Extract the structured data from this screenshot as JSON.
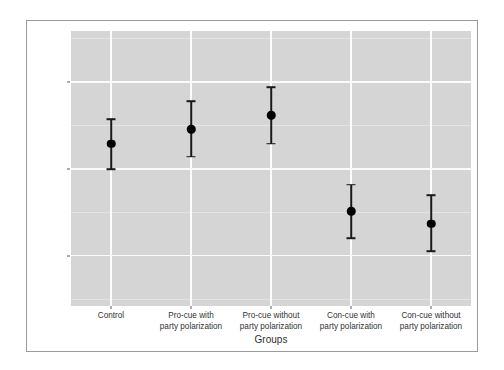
{
  "chart_data": {
    "type": "scatter",
    "title": "",
    "subtitle": "",
    "xlabel": "Groups",
    "ylabel_line1": "Support for the DREAM act",
    "ylabel_line2": "(7, stronger support, covariate is assumed at its mean)",
    "categories": [
      "Control",
      "Pro-cue with party polarization",
      "Pro-cue without party polarization",
      "Con-cue with party polarization",
      "Con-cue without party polarization"
    ],
    "category_label_lines": [
      [
        "Control"
      ],
      [
        "Pro-cue with",
        "party polarization"
      ],
      [
        "Pro-cue without",
        "party polarization"
      ],
      [
        "Con-cue with",
        "party polarization"
      ],
      [
        "Con-cue without",
        "party polarization"
      ]
    ],
    "values": [
      4.29,
      4.46,
      4.62,
      3.51,
      3.37
    ],
    "ci_lower": [
      4.0,
      4.14,
      4.29,
      3.2,
      3.05
    ],
    "ci_upper": [
      4.57,
      4.78,
      4.94,
      3.82,
      3.7
    ],
    "series": [
      {
        "name": "Predicted support",
        "values": [
          4.29,
          4.46,
          4.62,
          3.51,
          3.37
        ],
        "ci_lower": [
          4.0,
          4.14,
          4.29,
          3.2,
          3.05
        ],
        "ci_upper": [
          4.57,
          4.78,
          4.94,
          3.82,
          3.7
        ]
      }
    ],
    "ylim": [
      2.42,
      5.59
    ],
    "ytick_labels": [
      "5",
      "4",
      "3"
    ],
    "ytick_values": [
      5,
      4,
      3
    ],
    "yminor_values": [
      5.5,
      4.5,
      3.5,
      2.5
    ],
    "grid": true,
    "legend": "none",
    "panel_color": "#d5d5d5",
    "grid_color": "#fbfbfb",
    "point_color": "#000000",
    "errorbar_color": "#1a1a1a",
    "frame_color": "#9b9b9b"
  }
}
